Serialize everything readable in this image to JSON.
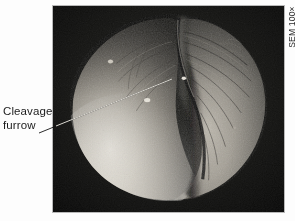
{
  "figure": {
    "kind": "scanning-electron-micrograph"
  },
  "callout": {
    "line1": "Cleavage",
    "line2": "furrow",
    "leader_from": {
      "x": 39,
      "y": 133
    },
    "leader_to": {
      "x": 173,
      "y": 79
    }
  },
  "magnification": {
    "label": "SEM 100×",
    "orientation": "vertical-bottom-to-top"
  },
  "colors": {
    "page_background": "#fdfdfd",
    "photo_background": "#0a0a0a",
    "photo_border": "#b9b9b9",
    "cell_highlight": "#e8e4dc",
    "cell_midtone": "#8d8a84",
    "cell_shadow": "#2a2926",
    "leader_line": "#141414",
    "text": "#1c1c1c"
  },
  "photo_frame": {
    "x": 52,
    "y": 5,
    "width": 233,
    "height": 208
  }
}
